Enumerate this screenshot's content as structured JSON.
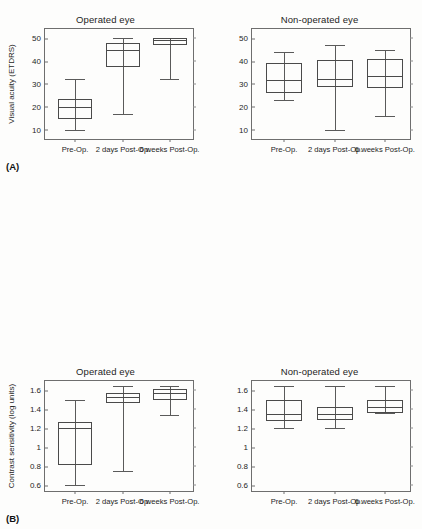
{
  "figure": {
    "panel_letters": [
      "(A)",
      "(B)",
      "(C)"
    ],
    "column_titles": [
      "Operated eye",
      "Non-operated eye"
    ],
    "categories": [
      "Pre-Op.",
      "2 days Post-Op.",
      "6 weeks Post-Op."
    ]
  },
  "chart_data": [
    {
      "type": "box",
      "panel": "(A)",
      "title": "Operated eye",
      "ylabel": "Visual acuity (ETDRS)",
      "xlabel": "",
      "ylim": [
        5,
        54
      ],
      "yticks": [
        10,
        20,
        30,
        40,
        50
      ],
      "ytick_labels": [
        "10",
        "20",
        "30",
        "40",
        "50"
      ],
      "grid": false,
      "categories": [
        "Pre-Op.",
        "2 days Post-Op.",
        "6 weeks Post-Op."
      ],
      "boxes": [
        {
          "category": "Pre-Op.",
          "min": 10.0,
          "q1": 14.5,
          "median": 20.0,
          "q3": 23.5,
          "max": 32.0
        },
        {
          "category": "2 days Post-Op.",
          "min": 17.0,
          "q1": 37.5,
          "median": 45.0,
          "q3": 48.0,
          "max": 50.0
        },
        {
          "category": "6 weeks Post-Op.",
          "min": 32.0,
          "q1": 47.0,
          "median": 49.0,
          "q3": 50.0,
          "max": 50.0
        }
      ]
    },
    {
      "type": "box",
      "panel": "(A)",
      "title": "Non-operated eye",
      "ylabel": "",
      "xlabel": "",
      "ylim": [
        5,
        54
      ],
      "yticks": [
        10,
        20,
        30,
        40,
        50
      ],
      "ytick_labels": [
        "10",
        "20",
        "30",
        "40",
        "50"
      ],
      "grid": false,
      "categories": [
        "Pre-Op.",
        "2 days Post-Op.",
        "6 weeks Post-Op."
      ],
      "boxes": [
        {
          "category": "Pre-Op.",
          "min": 23.0,
          "q1": 26.0,
          "median": 31.5,
          "q3": 39.0,
          "max": 44.0
        },
        {
          "category": "2 days Post-Op.",
          "min": 10.0,
          "q1": 28.5,
          "median": 32.0,
          "q3": 40.5,
          "max": 47.0
        },
        {
          "category": "6 weeks Post-Op.",
          "min": 16.0,
          "q1": 28.0,
          "median": 33.5,
          "q3": 41.0,
          "max": 45.0
        }
      ]
    },
    {
      "type": "box",
      "panel": "(B)",
      "title": "Operated eye",
      "ylabel": "Contrast sensitivity (log units)",
      "xlabel": "",
      "ylim": [
        0.52,
        1.7
      ],
      "yticks": [
        0.6,
        0.8,
        1.0,
        1.2,
        1.4,
        1.6
      ],
      "ytick_labels": [
        "0.6",
        "0.8",
        "1",
        "1.2",
        "1.4",
        "1.6"
      ],
      "grid": false,
      "categories": [
        "Pre-Op.",
        "2 days Post-Op.",
        "6 weeks Post-Op."
      ],
      "boxes": [
        {
          "category": "Pre-Op.",
          "min": 0.6,
          "q1": 0.82,
          "median": 1.2,
          "q3": 1.27,
          "max": 1.5
        },
        {
          "category": "2 days Post-Op.",
          "min": 0.75,
          "q1": 1.47,
          "median": 1.53,
          "q3": 1.57,
          "max": 1.65
        },
        {
          "category": "6 weeks Post-Op.",
          "min": 1.34,
          "q1": 1.5,
          "median": 1.57,
          "q3": 1.62,
          "max": 1.65
        }
      ]
    },
    {
      "type": "box",
      "panel": "(B)",
      "title": "Non-operated eye",
      "ylabel": "",
      "xlabel": "",
      "ylim": [
        0.52,
        1.7
      ],
      "yticks": [
        0.6,
        0.8,
        1.0,
        1.2,
        1.4,
        1.6
      ],
      "ytick_labels": [
        "0.6",
        "0.8",
        "1",
        "1.2",
        "1.4",
        "1.6"
      ],
      "grid": false,
      "categories": [
        "Pre-Op.",
        "2 days Post-Op.",
        "6 weeks Post-Op."
      ],
      "boxes": [
        {
          "category": "Pre-Op.",
          "min": 1.2,
          "q1": 1.28,
          "median": 1.35,
          "q3": 1.5,
          "max": 1.65
        },
        {
          "category": "2 days Post-Op.",
          "min": 1.2,
          "q1": 1.29,
          "median": 1.35,
          "q3": 1.43,
          "max": 1.65
        },
        {
          "category": "6 weeks Post-Op.",
          "min": 1.36,
          "q1": 1.36,
          "median": 1.43,
          "q3": 1.5,
          "max": 1.65
        }
      ]
    },
    {
      "type": "box",
      "panel": "(C)",
      "title": "Operated eye",
      "ylabel": "Mean sensitivity (dB)",
      "xlabel": "",
      "ylim": [
        12.5,
        30.5
      ],
      "yticks": [
        15,
        20,
        25,
        30
      ],
      "ytick_labels": [
        "15",
        "20",
        "25",
        "30"
      ],
      "grid": false,
      "categories": [
        "Pre-Op.",
        "2 days Post-Op.",
        "6 weeks Post-Op."
      ],
      "boxes": [
        {
          "category": "Pre-Op.",
          "min": 13.7,
          "q1": 15.5,
          "median": 20.0,
          "q3": 22.8,
          "max": 23.3
        },
        {
          "category": "2 days Post-Op.",
          "min": 19.0,
          "q1": 23.2,
          "median": 24.5,
          "q3": 25.7,
          "max": 27.5
        },
        {
          "category": "6 weeks Post-Op.",
          "min": 17.4,
          "q1": 23.7,
          "median": 24.9,
          "q3": 26.2,
          "max": 26.5
        }
      ]
    },
    {
      "type": "box",
      "panel": "(C)",
      "title": "Non-operated eye",
      "ylabel": "",
      "xlabel": "",
      "ylim": [
        12.5,
        30.5
      ],
      "yticks": [
        15,
        20,
        25,
        30
      ],
      "ytick_labels": [
        "15",
        "20",
        "25",
        "30"
      ],
      "grid": false,
      "categories": [
        "Pre-Op.",
        "2 days Post-Op.",
        "6 weeks Post-Op."
      ],
      "boxes": [
        {
          "category": "Pre-Op.",
          "min": 18.7,
          "q1": 20.0,
          "median": 20.0,
          "q3": 25.3,
          "max": 26.7
        },
        {
          "category": "2 days Post-Op.",
          "min": 20.0,
          "q1": 22.2,
          "median": 25.0,
          "q3": 25.8,
          "max": 27.0
        },
        {
          "category": "6 weeks Post-Op.",
          "min": 23.6,
          "q1": 23.6,
          "median": 24.8,
          "q3": 25.9,
          "max": 26.6
        }
      ]
    }
  ]
}
